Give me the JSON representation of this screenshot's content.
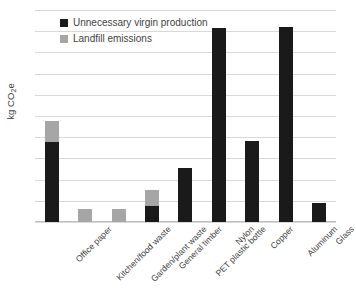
{
  "chart_data": {
    "type": "bar",
    "stacked": true,
    "title": "",
    "xlabel": "",
    "ylabel": "kg CO2e",
    "ylabel_html": "kg CO₂e",
    "ylim": [
      0,
      10
    ],
    "ytick_step": 1,
    "yticks": [
      "10",
      "9",
      "8",
      "7",
      "6",
      "5",
      "4",
      "3",
      "2",
      "1",
      "0"
    ],
    "grid": true,
    "grid_axis": "y",
    "legend_position": "upper-left-inside",
    "categories": [
      "Office paper",
      "Kitchen/food waste",
      "Garden/plant waste",
      "General timber",
      "PET plastic bottle",
      "Nylon",
      "Copper",
      "Aluminum",
      "Glass"
    ],
    "series": [
      {
        "name": "Unnecessary virgin production",
        "color": "#1a1a1a",
        "values": [
          3.77,
          0,
          0,
          0.75,
          2.53,
          9.15,
          3.82,
          9.18,
          0.92
        ]
      },
      {
        "name": "Landfill emissions",
        "color": "#a6a6a6",
        "values": [
          0.99,
          0.62,
          0.6,
          0.78,
          0,
          0,
          0,
          0,
          0
        ]
      }
    ],
    "totals": [
      4.76,
      0.62,
      0.6,
      1.53,
      2.53,
      9.15,
      3.82,
      9.18,
      0.92
    ]
  },
  "legend": {
    "items": [
      {
        "label": "Unnecessary virgin production",
        "color": "#1a1a1a"
      },
      {
        "label": "Landfill emissions",
        "color": "#a6a6a6"
      }
    ]
  },
  "colors": {
    "virgin": "#1a1a1a",
    "landfill": "#a6a6a6",
    "grid": "#d9d9d9",
    "text": "#3f3f3f",
    "background": "#ffffff"
  }
}
